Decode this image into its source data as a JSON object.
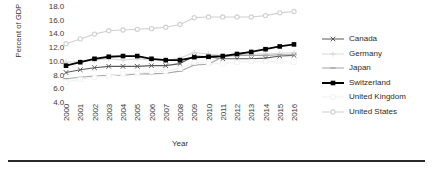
{
  "chart_data": {
    "type": "line",
    "title": "",
    "xlabel": "Year",
    "ylabel": "Percent of GDP",
    "x": [
      2000,
      2001,
      2002,
      2003,
      2004,
      2005,
      2006,
      2007,
      2008,
      2009,
      2010,
      2011,
      2012,
      2013,
      2014,
      2015,
      2016
    ],
    "xticklabels": [
      "2000",
      "2001",
      "2002",
      "2003",
      "2004",
      "2005",
      "2006",
      "2007",
      "2008",
      "2009",
      "2010",
      "2011",
      "2012",
      "2013",
      "2014",
      "2015",
      "2016"
    ],
    "yticklabels": [
      "18.0",
      "16.0",
      "14.0",
      "12.0",
      "10.0",
      "8.0",
      "6.0",
      "4.0"
    ],
    "ylim": [
      4.0,
      18.0
    ],
    "ytick_step": 2.0,
    "xlim": [
      2000,
      2016
    ],
    "grid": false,
    "legend_position": "right",
    "series": [
      {
        "name": "Canada",
        "color": "#595959",
        "marker": "x",
        "values": [
          8.3,
          8.7,
          9.0,
          9.2,
          9.2,
          9.2,
          9.3,
          9.3,
          9.6,
          10.7,
          10.6,
          10.3,
          10.3,
          10.3,
          10.4,
          10.7,
          10.8
        ]
      },
      {
        "name": "Germany",
        "color": "#d9d9d9",
        "marker": "plus",
        "values": [
          9.8,
          9.9,
          10.1,
          10.3,
          10.1,
          10.3,
          10.1,
          10.1,
          10.4,
          11.2,
          11.0,
          10.8,
          10.9,
          11.0,
          11.0,
          11.1,
          11.2
        ]
      },
      {
        "name": "Japan",
        "color": "#a6a6a6",
        "marker": "dash",
        "values": [
          7.4,
          7.6,
          7.8,
          7.9,
          7.9,
          8.1,
          8.1,
          8.2,
          8.5,
          9.4,
          9.5,
          10.6,
          10.8,
          10.8,
          10.8,
          10.9,
          10.9
        ]
      },
      {
        "name": "Switzerland",
        "color": "#000000",
        "marker": "square",
        "values": [
          9.3,
          9.8,
          10.3,
          10.6,
          10.7,
          10.7,
          10.3,
          10.1,
          10.1,
          10.5,
          10.6,
          10.7,
          11.0,
          11.3,
          11.7,
          12.1,
          12.4
        ]
      },
      {
        "name": "United Kingdom",
        "color": "#f2f2f2",
        "marker": "square-open",
        "values": [
          6.9,
          7.3,
          7.6,
          7.8,
          8.1,
          8.2,
          8.4,
          8.5,
          8.9,
          9.8,
          9.6,
          9.6,
          9.8,
          9.9,
          9.9,
          9.9,
          9.8
        ]
      },
      {
        "name": "United States",
        "color": "#d0d0d0",
        "marker": "circle",
        "values": [
          12.5,
          13.2,
          13.9,
          14.4,
          14.5,
          14.6,
          14.7,
          14.9,
          15.3,
          16.3,
          16.4,
          16.4,
          16.4,
          16.4,
          16.6,
          17.0,
          17.2
        ]
      }
    ]
  },
  "axis": {
    "y_title": "Percent of GDP",
    "x_title": "Year"
  }
}
